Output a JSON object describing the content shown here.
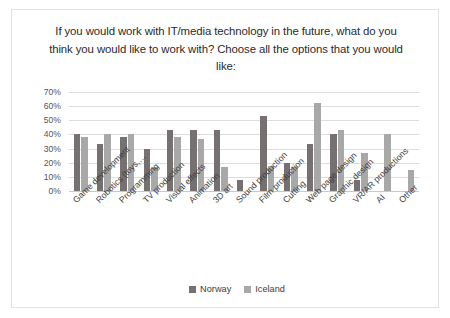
{
  "chart_data": {
    "type": "bar",
    "title": "If you would work with IT/media technology in the future, what do you think you would like to work with? Choose all the options that you would like:",
    "xlabel": "",
    "ylabel": "",
    "ylim": [
      0,
      70
    ],
    "ytick_labels": [
      "70%",
      "60%",
      "50%",
      "40%",
      "30%",
      "20%",
      "10%",
      "0%"
    ],
    "ytick_values": [
      70,
      60,
      50,
      40,
      30,
      20,
      10,
      0
    ],
    "grid": true,
    "legend_position": "bottom",
    "categories": [
      "Game development",
      "Robotics (toys,…",
      "Programming",
      "TV production",
      "Visual effects",
      "Animation",
      "3D art",
      "Sound production",
      "Film production",
      "Cutting",
      "Web page design",
      "Graphic design",
      "VR/AR productions",
      "AI",
      "Other"
    ],
    "series": [
      {
        "name": "Norway",
        "color": "#767171",
        "values": [
          40,
          33,
          38,
          30,
          43,
          43,
          43,
          8,
          53,
          20,
          33,
          40,
          8,
          0,
          0
        ]
      },
      {
        "name": "Iceland",
        "color": "#a8a8a8",
        "values": [
          38,
          40,
          40,
          17,
          38,
          37,
          17,
          0,
          18,
          17,
          62,
          43,
          27,
          40,
          15
        ]
      }
    ]
  },
  "legend": {
    "entries": [
      {
        "label": "Norway",
        "color": "#767171"
      },
      {
        "label": "Iceland",
        "color": "#a8a8a8"
      }
    ]
  }
}
